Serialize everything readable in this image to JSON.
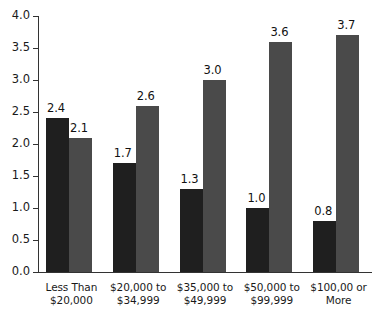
{
  "chart_data": {
    "type": "bar",
    "title": "",
    "subtitle": "",
    "xlabel": "",
    "ylabel": "",
    "ylim": [
      0.0,
      4.0
    ],
    "ytick_step": 0.5,
    "grid": false,
    "legend": "none",
    "grouping": "grouped",
    "categories": [
      "Less Than\n$20,000",
      "$20,000 to\n$34,999",
      "$35,000 to\n$49,999",
      "$50,000 to\n$99,999",
      "$100,00 or\nMore"
    ],
    "yticks": [
      "0.0",
      "0.5",
      "1.0",
      "1.5",
      "2.0",
      "2.5",
      "3.0",
      "3.5",
      "4.0"
    ],
    "ytick_values": [
      0.0,
      0.5,
      1.0,
      1.5,
      2.0,
      2.5,
      3.0,
      3.5,
      4.0
    ],
    "series": [
      {
        "name": "series-1",
        "color": "#1f1f1f",
        "values": [
          2.4,
          1.7,
          1.3,
          1.0,
          0.8
        ],
        "labels": [
          "2.4",
          "1.7",
          "1.3",
          "1.0",
          "0.8"
        ]
      },
      {
        "name": "series-2",
        "color": "#4a4a4a",
        "values": [
          2.1,
          2.6,
          3.0,
          3.6,
          3.7
        ],
        "labels": [
          "2.1",
          "2.6",
          "3.0",
          "3.6",
          "3.7"
        ]
      }
    ]
  },
  "colors": {
    "series_1": "#1f1f1f",
    "series_2": "#4a4a4a",
    "axis": "#333333",
    "text": "#1a1a1a",
    "background": "#ffffff"
  }
}
